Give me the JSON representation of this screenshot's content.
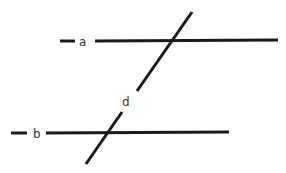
{
  "diagram": {
    "stroke_color": "#1a1a1a",
    "label_color": "#333333",
    "lines": [
      {
        "id": "a",
        "label": "a"
      },
      {
        "id": "b",
        "label": "b"
      },
      {
        "id": "d",
        "label": "d"
      }
    ]
  }
}
